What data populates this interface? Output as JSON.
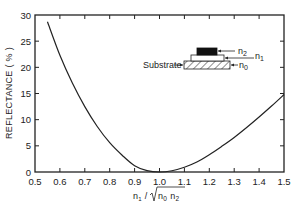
{
  "chart_data": {
    "type": "line",
    "title": "",
    "xlabel": "n1 / √(n0 n2)",
    "ylabel": "REFLECTANCE (%)",
    "xlim": [
      0.5,
      1.5
    ],
    "ylim": [
      0,
      30
    ],
    "xticks": [
      "0.5",
      "0.6",
      "0.7",
      "0.8",
      "0.9",
      "1.0",
      "1.1",
      "1.2",
      "1.3",
      "1.4",
      "1.5"
    ],
    "yticks": [
      "0",
      "5",
      "10",
      "15",
      "20",
      "25",
      "30"
    ],
    "grid": false,
    "legend": null,
    "series": [
      {
        "name": "Reflectance",
        "x": [
          0.55,
          0.6,
          0.65,
          0.7,
          0.75,
          0.8,
          0.85,
          0.9,
          0.95,
          1.0,
          1.05,
          1.1,
          1.15,
          1.2,
          1.25,
          1.3,
          1.35,
          1.4,
          1.45,
          1.5
        ],
        "values": [
          28.7,
          22.3,
          17.0,
          12.5,
          8.7,
          5.6,
          3.2,
          1.2,
          0.26,
          0.0,
          0.24,
          0.9,
          1.9,
          3.3,
          4.9,
          6.6,
          8.5,
          10.5,
          12.6,
          14.8
        ]
      }
    ],
    "inset": {
      "labels": {
        "substrate": "Substrate",
        "n0": "n",
        "n0_sub": "0",
        "n1": "n",
        "n1_sub": "1",
        "n2": "n",
        "n2_sub": "2"
      }
    }
  },
  "axis": {
    "x_title_n1": "n",
    "x_title_n1_sub": "1",
    "x_title_slash": " / ",
    "x_title_n0": "n",
    "x_title_n0_sub": "0",
    "x_title_n2": "n",
    "x_title_n2_sub": "2",
    "y_title": "REFLECTANCE  ( % )"
  }
}
